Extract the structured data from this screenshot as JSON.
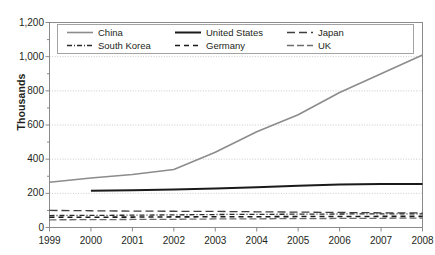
{
  "chart_data": {
    "type": "line",
    "title": "",
    "xlabel": "",
    "ylabel": "Thousands",
    "x": [
      1999,
      2000,
      2001,
      2002,
      2003,
      2004,
      2005,
      2006,
      2007,
      2008
    ],
    "xlim": [
      1999,
      2008
    ],
    "ylim": [
      0,
      1200
    ],
    "yticks": [
      0,
      200,
      400,
      600,
      800,
      1000,
      1200
    ],
    "ytick_labels": [
      "0",
      "200",
      "400",
      "600",
      "800",
      "1,000",
      "1,200"
    ],
    "xtick_labels": [
      "1999",
      "2000",
      "2001",
      "2002",
      "2003",
      "2004",
      "2005",
      "2006",
      "2007",
      "2008"
    ],
    "grid": true,
    "grid_axis": "y",
    "grid_style": "dotted",
    "legend_position": "top-inside",
    "series": [
      {
        "name": "China",
        "values": [
          265,
          290,
          310,
          340,
          440,
          560,
          660,
          790,
          900,
          1010
        ],
        "color": "#8c8c8c",
        "dash": "none",
        "width": 1.6
      },
      {
        "name": "United States",
        "values": [
          null,
          215,
          218,
          222,
          228,
          236,
          244,
          252,
          254,
          255
        ],
        "color": "#1a1a1a",
        "dash": "none",
        "width": 2.0
      },
      {
        "name": "Japan",
        "values": [
          100,
          98,
          96,
          95,
          94,
          92,
          90,
          88,
          86,
          85
        ],
        "color": "#3f3f3f",
        "dash": "8,4",
        "width": 1.3
      },
      {
        "name": "South Korea",
        "values": [
          70,
          71,
          72,
          74,
          76,
          77,
          78,
          79,
          80,
          80
        ],
        "color": "#2b2b2b",
        "dash": "5,2,1,2",
        "width": 1.3
      },
      {
        "name": "Germany",
        "values": [
          60,
          60,
          61,
          62,
          63,
          63,
          64,
          64,
          65,
          65
        ],
        "color": "#1a1a1a",
        "dash": "5,4",
        "width": 1.6
      },
      {
        "name": "UK",
        "values": [
          45,
          46,
          47,
          48,
          50,
          51,
          52,
          53,
          54,
          55
        ],
        "color": "#6e6e6e",
        "dash": "7,3",
        "width": 1.3
      }
    ]
  },
  "legend": {
    "entries": [
      {
        "label": "China",
        "row": 0,
        "col": 0
      },
      {
        "label": "United States",
        "row": 0,
        "col": 1
      },
      {
        "label": "Japan",
        "row": 0,
        "col": 2
      },
      {
        "label": "South Korea",
        "row": 1,
        "col": 0
      },
      {
        "label": "Germany",
        "row": 1,
        "col": 1
      },
      {
        "label": "UK",
        "row": 1,
        "col": 2
      }
    ]
  },
  "colors": {
    "axis": "#8a8a8a",
    "grid": "#bdbdbd",
    "text": "#231f20",
    "plot_background": "#ffffff"
  }
}
